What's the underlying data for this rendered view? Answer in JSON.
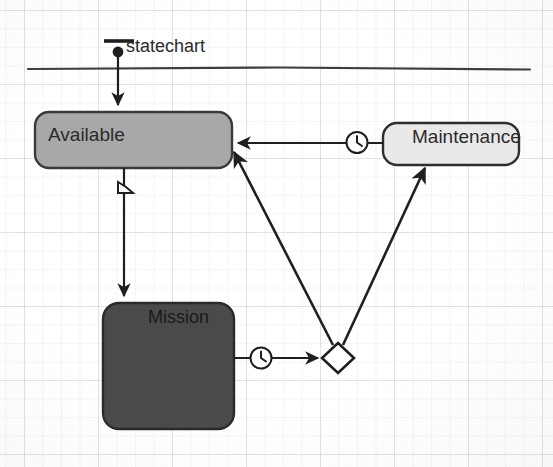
{
  "diagram": {
    "kind": "uml-statechart",
    "frame_label": "statechart",
    "background": "#ffffff",
    "line_color": "#1f1f1f"
  },
  "states": [
    {
      "id": "available",
      "label": "Available",
      "fill": "#a8a8a8",
      "stroke": "#3a3a3a",
      "x": 35,
      "y": 112,
      "w": 197,
      "h": 56,
      "text_align": "left"
    },
    {
      "id": "maintenance",
      "label": "Maintenance",
      "fill": "#e9e9e9",
      "stroke": "#2e2e2e",
      "x": 383,
      "y": 123,
      "w": 136,
      "h": 42,
      "text_align": "center"
    },
    {
      "id": "mission",
      "label": "Mission",
      "fill": "#4a4a4a",
      "stroke": "#2a2a2a",
      "x": 103,
      "y": 303,
      "w": 131,
      "h": 126,
      "text_align": "center"
    }
  ],
  "pseudostates": [
    {
      "id": "initial",
      "type": "initial-node",
      "shape": "filled-circle",
      "cx": 118,
      "cy": 52,
      "r": 5,
      "fill": "#1f1f1f"
    },
    {
      "id": "junction",
      "type": "choice-junction",
      "shape": "diamond",
      "cx": 338,
      "cy": 358,
      "rx": 16,
      "ry": 15,
      "fill": "#ffffff",
      "stroke": "#1f1f1f"
    }
  ],
  "transitions": [
    {
      "id": "initial-to-available",
      "from": "initial",
      "to": "available",
      "marker": "none",
      "arrowhead": true
    },
    {
      "id": "available-to-mission",
      "from": "available",
      "to": "mission",
      "marker": "signal-event-icon",
      "arrowhead": true
    },
    {
      "id": "maintenance-to-available",
      "from": "maintenance",
      "to": "available",
      "marker": "clock-icon",
      "arrowhead": true
    },
    {
      "id": "mission-to-junction",
      "from": "mission",
      "to": "junction",
      "marker": "clock-icon",
      "arrowhead": true
    },
    {
      "id": "junction-to-available",
      "from": "junction",
      "to": "available",
      "marker": "none",
      "arrowhead": true
    },
    {
      "id": "junction-to-maintenance",
      "from": "junction",
      "to": "maintenance",
      "marker": "none",
      "arrowhead": true
    }
  ],
  "icons": {
    "clock": "clock-icon",
    "signal_event": "signal-event-icon",
    "initial_bar": "initial-bar-icon"
  }
}
